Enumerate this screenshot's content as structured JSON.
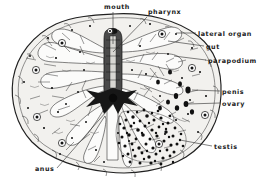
{
  "figure": {
    "organism_view": "dorsal whole mount",
    "background_color": "#ffffff",
    "body_fill_color": "#f2f1ee",
    "ink_color": "#1a1a1a",
    "labels": [
      {
        "id": "mouth",
        "text": "mouth",
        "x": 104,
        "y": 9,
        "anchor": "start"
      },
      {
        "id": "pharynx",
        "text": "pharynx",
        "x": 148,
        "y": 13,
        "anchor": "start"
      },
      {
        "id": "lateral-organ",
        "text": "lateral organ",
        "x": 198,
        "y": 35,
        "anchor": "start"
      },
      {
        "id": "gut",
        "text": "gut",
        "x": 206,
        "y": 48,
        "anchor": "start"
      },
      {
        "id": "parapodium",
        "text": "parapodium",
        "x": 208,
        "y": 62,
        "anchor": "start"
      },
      {
        "id": "penis",
        "text": "penis",
        "x": 222,
        "y": 93,
        "anchor": "start"
      },
      {
        "id": "ovary",
        "text": "ovary",
        "x": 222,
        "y": 105,
        "anchor": "start"
      },
      {
        "id": "testis",
        "text": "testis",
        "x": 214,
        "y": 148,
        "anchor": "start"
      },
      {
        "id": "anus",
        "text": "anus",
        "x": 35,
        "y": 170,
        "anchor": "start"
      }
    ],
    "leaders": [
      {
        "id": "mouth",
        "path": "M113,12 L113,44"
      },
      {
        "id": "pharynx",
        "path": "M147,16 L112,50"
      },
      {
        "id": "lateral-organ",
        "path": "M196,33 L178,33"
      },
      {
        "id": "gut",
        "path": "M204,46 L170,40"
      },
      {
        "id": "parapodium",
        "path": "M206,60 L176,55"
      },
      {
        "id": "penis",
        "path": "M220,91 L194,91"
      },
      {
        "id": "ovary",
        "path": "M220,103 L190,103"
      },
      {
        "id": "testis",
        "path": "M212,146 L182,141"
      },
      {
        "id": "anus",
        "path": "M56,168 L113,105"
      }
    ],
    "lateral_organs": [
      {
        "x": 62,
        "y": 43
      },
      {
        "x": 36,
        "y": 70
      },
      {
        "x": 37,
        "y": 117
      },
      {
        "x": 62,
        "y": 143
      },
      {
        "x": 162,
        "y": 34
      },
      {
        "x": 192,
        "y": 68
      },
      {
        "x": 205,
        "y": 115
      },
      {
        "x": 159,
        "y": 144
      },
      {
        "x": 110,
        "y": 31
      }
    ],
    "pharynx_center": {
      "x": 113,
      "y": 98
    },
    "testis_field": {
      "cx": 148,
      "cy": 135,
      "count": 120
    },
    "structures": [
      {
        "name": "body-outline"
      },
      {
        "name": "pharynx"
      },
      {
        "name": "gut-branches"
      },
      {
        "name": "testis-granules"
      },
      {
        "name": "lateral-organ-rings"
      },
      {
        "name": "parapodia-margin"
      }
    ]
  }
}
